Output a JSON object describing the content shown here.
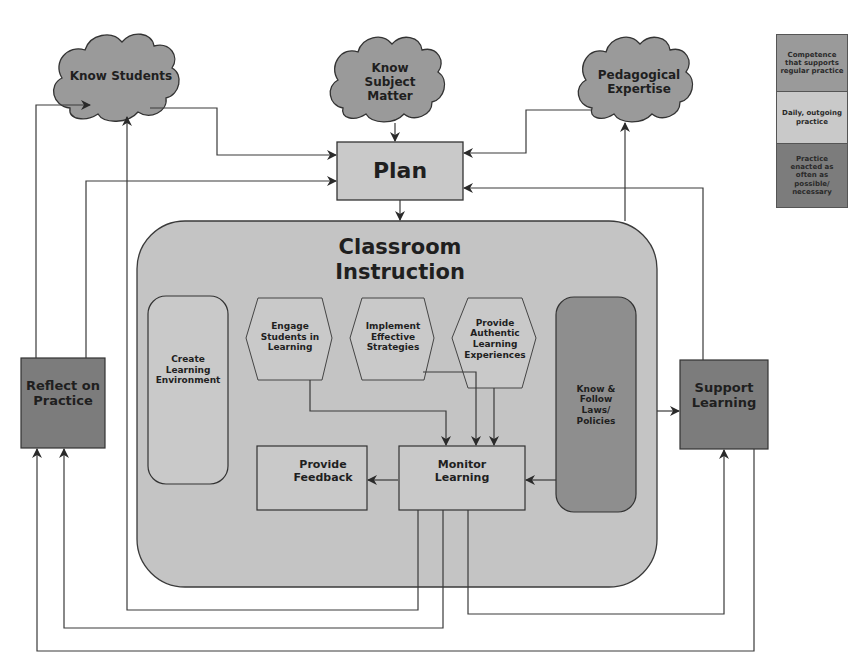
{
  "colors": {
    "competence": "#9a9a9a",
    "daily": "#c9c9c9",
    "enacted": "#7c7c7c",
    "container": "#c4c4c4",
    "line": "#3a3a3a"
  },
  "clouds": {
    "know_students": "Know Students",
    "know_subject": "Know Subject Matter",
    "pedagogical": "Pedagogical Expertise"
  },
  "plan": "Plan",
  "classroom": {
    "title": "Classroom Instruction",
    "create_env": "Create Learning Environment",
    "engage": "Engage Students in Learning",
    "implement": "Implement Effective Strategies",
    "authentic": "Provide Authentic Learning Experiences",
    "laws": "Know & Follow Laws/ Policies",
    "feedback": "Provide Feedback",
    "monitor": "Monitor Learning"
  },
  "reflect": "Reflect on Practice",
  "support": "Support Learning",
  "legend": [
    {
      "label": "Competence that supports regular practice",
      "color": "#9a9a9a"
    },
    {
      "label": "Daily, outgoing practice",
      "color": "#c9c9c9"
    },
    {
      "label": "Practice enacted as often as possible/ necessary",
      "color": "#7c7c7c"
    }
  ]
}
